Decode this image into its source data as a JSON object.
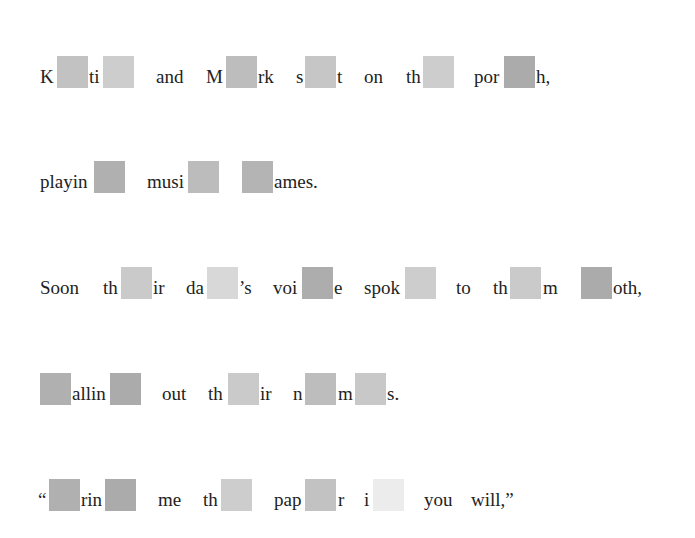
{
  "colors": {
    "dark": "#ababab",
    "mid": "#bdbdbd",
    "light": "#cacaca",
    "lighter": "#d6d6d6",
    "faint": "#ececec"
  },
  "lines": [
    {
      "text": "K__ti__ and M__rk s__t on th__ por__h,",
      "segments": [
        "K",
        "ti",
        "and",
        "M",
        "rk",
        "s",
        "t",
        "on",
        "th",
        "por",
        "h,"
      ]
    },
    {
      "text": "playin__ musi__ __ames.",
      "segments": [
        "playin",
        "musi",
        "ames."
      ]
    },
    {
      "text": "Soon th__ir da__'s voi__e spok__ to th__m __oth,",
      "segments": [
        "Soon",
        "th",
        "ir",
        "da",
        "’s",
        "voi",
        "e",
        "spok",
        "to",
        "th",
        "m",
        "oth,"
      ]
    },
    {
      "text": "__allin__ out th__ir n__m__s.",
      "segments": [
        "allin",
        "out",
        "th",
        "ir",
        "n",
        "m",
        "s."
      ]
    },
    {
      "text": "“__rin__ me th__ pap__r i__ you will,”",
      "segments": [
        "“",
        "rin",
        "me",
        "th",
        "pap",
        "r",
        "i",
        "you",
        "will,”"
      ]
    }
  ]
}
